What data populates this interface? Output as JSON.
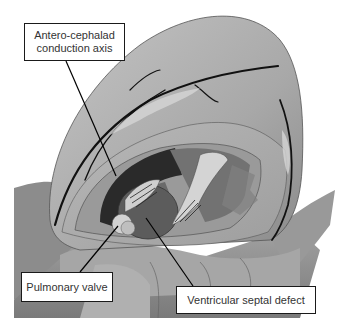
{
  "figure": {
    "colors": {
      "background": "#ffffff",
      "tissue_light": "#b5b5b5",
      "tissue_mid": "#9a9a9a",
      "tissue_dark": "#6e6e6e",
      "cavity_dark": "#2a2a2a",
      "vessel": "#111111",
      "label_border": "#1a1a1a"
    }
  },
  "labels": [
    {
      "id": "antero-cephalad",
      "text_line1": "Antero-cephalad",
      "text_line2": "conduction axis"
    },
    {
      "id": "pulmonary-valve",
      "text": "Pulmonary valve"
    },
    {
      "id": "vsd",
      "text": "Ventricular septal defect"
    }
  ]
}
